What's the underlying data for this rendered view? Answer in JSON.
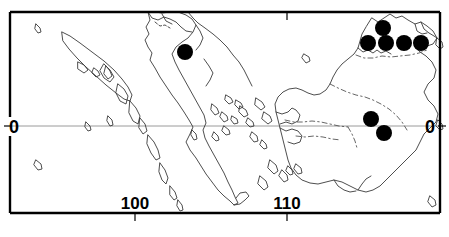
{
  "figure": {
    "kind": "distribution-map",
    "region_names": [
      "Sumatra",
      "Borneo"
    ],
    "background_color": "#ffffff",
    "frame_color": "#000000",
    "coastline_color": "#3a3a3a",
    "internal_border_color": "#555555",
    "equator_line_color": "#9a9a9a",
    "marker_color": "#000000",
    "marker_radius_px": 8
  },
  "axes": {
    "longitude_ticks": [
      {
        "label": "100",
        "x_px": 135
      },
      {
        "label": "110",
        "x_px": 287
      }
    ],
    "latitude_labels": [
      {
        "label": "0",
        "side": "left",
        "x_px": 14,
        "y_px": 126
      },
      {
        "label": "0",
        "side": "right",
        "x_px": 430,
        "y_px": 126
      }
    ],
    "equator_y_px": 126,
    "frame": {
      "left": 10,
      "top": 12,
      "right": 440,
      "bottom": 213
    }
  },
  "markers": [
    {
      "id": "sumatra-1",
      "x_px": 185,
      "y_px": 52,
      "region": "Sumatra"
    },
    {
      "id": "borneo-n-1",
      "x_px": 383,
      "y_px": 28,
      "region": "Borneo"
    },
    {
      "id": "borneo-n-2",
      "x_px": 368,
      "y_px": 43,
      "region": "Borneo"
    },
    {
      "id": "borneo-n-3",
      "x_px": 386,
      "y_px": 43,
      "region": "Borneo"
    },
    {
      "id": "borneo-n-4",
      "x_px": 404,
      "y_px": 43,
      "region": "Borneo"
    },
    {
      "id": "borneo-n-5",
      "x_px": 421,
      "y_px": 43,
      "region": "Borneo"
    },
    {
      "id": "borneo-c-1",
      "x_px": 371,
      "y_px": 119,
      "region": "Borneo"
    },
    {
      "id": "borneo-c-2",
      "x_px": 384,
      "y_px": 133,
      "region": "Borneo"
    }
  ],
  "marker_count": 8
}
